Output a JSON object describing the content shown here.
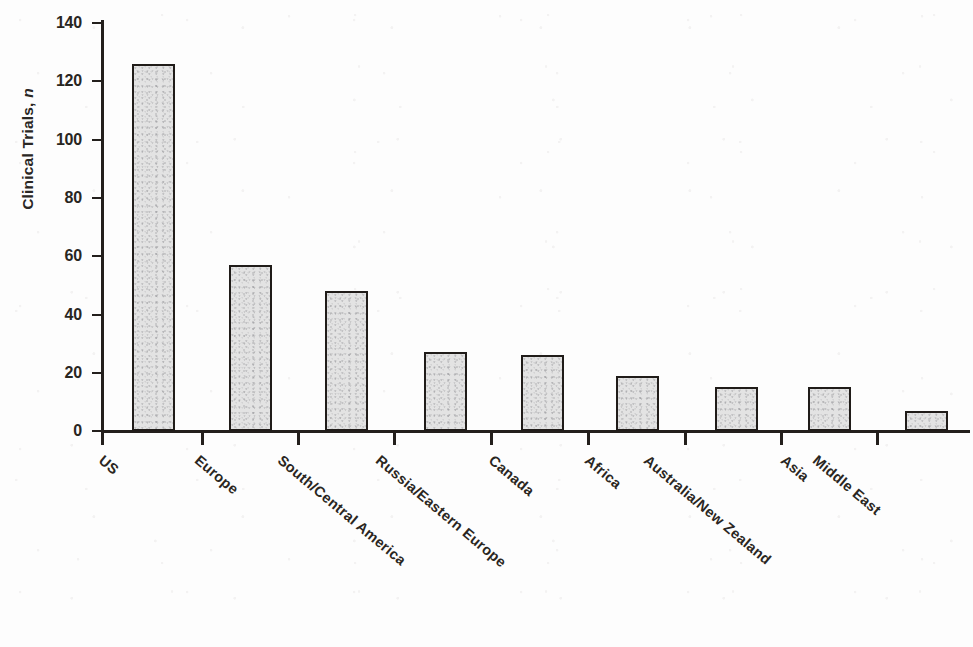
{
  "chart_data": {
    "type": "bar",
    "title": "",
    "subtitle": "",
    "xlabel": "",
    "ylabel": "Clinical Trials, n",
    "ylabel_plain": "Clinical Trials,",
    "ylabel_italic": "n",
    "categories": [
      "US",
      "Europe",
      "South/Central America",
      "Russia/Eastern Europe",
      "Canada",
      "Africa",
      "Australia/New Zealand",
      "Asia",
      "Middle East"
    ],
    "values": [
      126,
      57,
      48,
      27,
      26,
      19,
      15,
      15,
      7
    ],
    "ylim": [
      0,
      140
    ],
    "ytick_values": [
      0,
      20,
      40,
      60,
      80,
      100,
      120,
      140
    ],
    "ytick_labels": [
      "0",
      "20",
      "40",
      "60",
      "80",
      "100",
      "120",
      "140"
    ],
    "grid": false,
    "legend": null,
    "legend_position": "none",
    "bar_fill_color": "#e3e3e3",
    "bar_edge_color": "#201c19",
    "axis_color": "#231f1c",
    "background_color": "#ffffff",
    "annotations": []
  },
  "figure": {
    "caption": "",
    "alt": "Bar chart of clinical trials by world region"
  }
}
